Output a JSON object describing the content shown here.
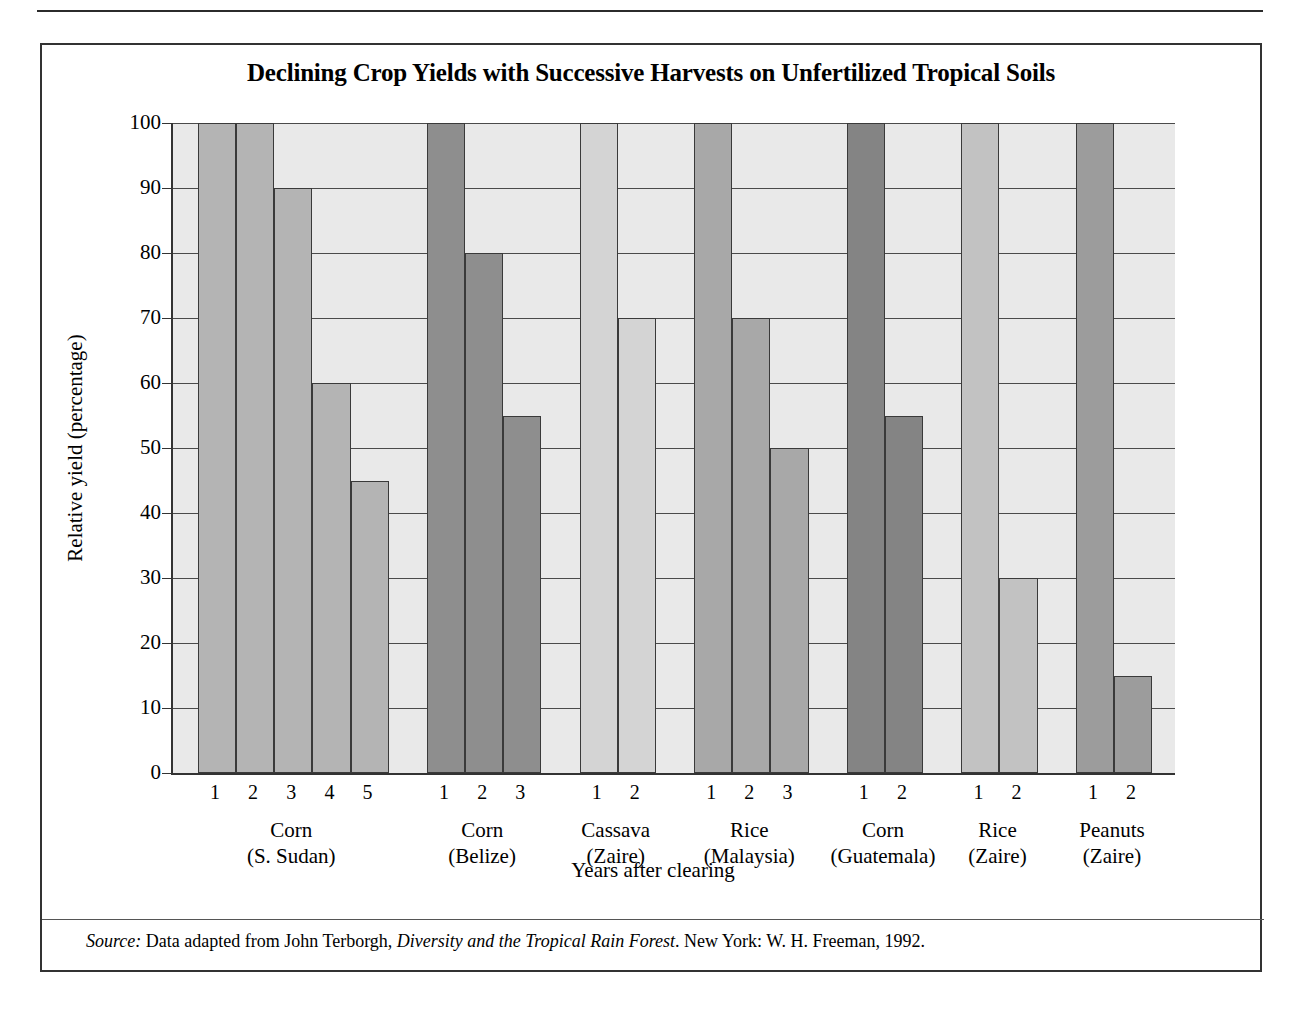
{
  "figure": {
    "title": "Declining Crop Yields with Successive Harvests on Unfertilized Tropical Soils",
    "source_label": "Source:",
    "source_text_1": " Data adapted from John Terborgh, ",
    "source_italic": "Diversity and the Tropical Rain Forest",
    "source_text_2": ". New York: W. H. Freeman, 1992."
  },
  "chart_data": {
    "type": "bar",
    "title": "Declining Crop Yields with Successive Harvests on Unfertilized Tropical Soils",
    "xlabel": "Years after clearing",
    "ylabel": "Relative yield (percentage)",
    "ylim": [
      0,
      100
    ],
    "ytick_labels": [
      "100",
      "90",
      "80",
      "70",
      "60",
      "50",
      "40",
      "30",
      "20",
      "10",
      "0"
    ],
    "ytick_values": [
      100,
      90,
      80,
      70,
      60,
      50,
      40,
      30,
      20,
      10,
      0
    ],
    "grid": "horizontal",
    "legend": "none",
    "groups": [
      {
        "crop": "Corn",
        "region": "(S. Sudan)",
        "color": "#b4b4b4",
        "categories": [
          "1",
          "2",
          "3",
          "4",
          "5"
        ],
        "values": [
          100,
          100,
          90,
          60,
          45
        ]
      },
      {
        "crop": "Corn",
        "region": "(Belize)",
        "color": "#8e8e8e",
        "categories": [
          "1",
          "2",
          "3"
        ],
        "values": [
          100,
          80,
          55
        ]
      },
      {
        "crop": "Cassava",
        "region": "(Zaire)",
        "color": "#d4d4d4",
        "categories": [
          "1",
          "2"
        ],
        "values": [
          100,
          70
        ]
      },
      {
        "crop": "Rice",
        "region": "(Malaysia)",
        "color": "#a8a8a8",
        "categories": [
          "1",
          "2",
          "3"
        ],
        "values": [
          100,
          70,
          50
        ]
      },
      {
        "crop": "Corn",
        "region": "(Guatemala)",
        "color": "#848484",
        "categories": [
          "1",
          "2"
        ],
        "values": [
          100,
          55
        ]
      },
      {
        "crop": "Rice",
        "region": "(Zaire)",
        "color": "#c2c2c2",
        "categories": [
          "1",
          "2"
        ],
        "values": [
          100,
          30
        ]
      },
      {
        "crop": "Peanuts",
        "region": "(Zaire)",
        "color": "#9c9c9c",
        "categories": [
          "1",
          "2"
        ],
        "values": [
          100,
          15
        ]
      }
    ]
  },
  "colors": {
    "plot_background": "#e9e9e9",
    "axis": "#333333",
    "gridline": "#4a4a4a",
    "text": "#000000"
  }
}
